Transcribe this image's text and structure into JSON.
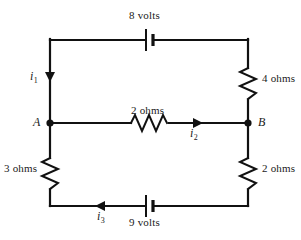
{
  "diagram": {
    "type": "electrical-circuit-schematic",
    "stroke_color": "#111111",
    "background_color": "#ffffff",
    "nodes": [
      {
        "id": "A",
        "label": "A",
        "x": 50,
        "y": 123
      },
      {
        "id": "B",
        "label": "B",
        "x": 248,
        "y": 123
      }
    ],
    "components": [
      {
        "id": "battery-top",
        "kind": "battery",
        "label": "8 volts",
        "value": 8,
        "unit": "volts",
        "branch": "top",
        "orientation": "horizontal"
      },
      {
        "id": "resistor-right-top",
        "kind": "resistor",
        "label": "4 ohms",
        "value": 4,
        "unit": "ohms",
        "branch": "right-upper",
        "orientation": "vertical"
      },
      {
        "id": "resistor-middle",
        "kind": "resistor",
        "label": "2 ohms",
        "value": 2,
        "unit": "ohms",
        "branch": "middle",
        "orientation": "horizontal"
      },
      {
        "id": "resistor-left",
        "kind": "resistor",
        "label": "3 ohms",
        "value": 3,
        "unit": "ohms",
        "branch": "left-lower",
        "orientation": "vertical"
      },
      {
        "id": "resistor-right-bottom",
        "kind": "resistor",
        "label": "2 ohms",
        "value": 2,
        "unit": "ohms",
        "branch": "right-lower",
        "orientation": "vertical"
      },
      {
        "id": "battery-bottom",
        "kind": "battery",
        "label": "9 volts",
        "value": 9,
        "unit": "volts",
        "branch": "bottom",
        "orientation": "horizontal"
      }
    ],
    "currents": [
      {
        "id": "i1",
        "symbol": "i",
        "subscript": "1",
        "branch": "left-upper",
        "direction": "down"
      },
      {
        "id": "i2",
        "symbol": "i",
        "subscript": "2",
        "branch": "middle",
        "direction": "right"
      },
      {
        "id": "i3",
        "symbol": "i",
        "subscript": "3",
        "branch": "bottom",
        "direction": "left"
      }
    ]
  }
}
